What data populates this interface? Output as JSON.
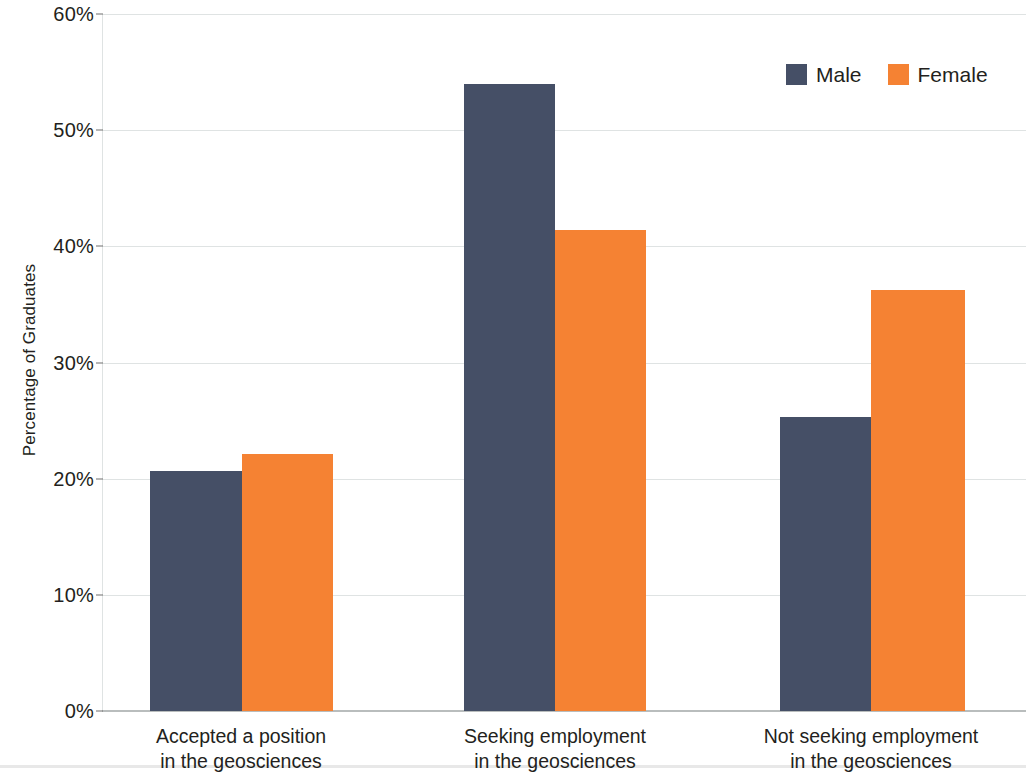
{
  "chart_data": {
    "type": "bar",
    "title": "",
    "subtitle": "",
    "xlabel": "",
    "ylabel": "Percentage of Graduates",
    "ylim": [
      0,
      60
    ],
    "ytick_values": [
      0,
      10,
      20,
      30,
      40,
      50,
      60
    ],
    "ytick_labels": [
      "0%",
      "10%",
      "20%",
      "30%",
      "40%",
      "50%",
      "60%"
    ],
    "grid": true,
    "legend_position": "top-right",
    "categories": [
      "Accepted a position in the geosciences",
      "Seeking employment in the geosciences",
      "Not seeking employment in the geosciences"
    ],
    "category_lines": [
      [
        "Accepted a position",
        "in the geosciences"
      ],
      [
        "Seeking employment",
        "in the geosciences"
      ],
      [
        "Not seeking employment",
        "in the geosciences"
      ]
    ],
    "series": [
      {
        "name": "Male",
        "color": "#454f66",
        "values": [
          20.7,
          54.0,
          25.3
        ]
      },
      {
        "name": "Female",
        "color": "#f58233",
        "values": [
          22.1,
          41.4,
          36.2
        ]
      }
    ]
  },
  "legend": {
    "items": [
      {
        "label": "Male",
        "swatch": "legend-swatch-male"
      },
      {
        "label": "Female",
        "swatch": "legend-swatch-female"
      }
    ]
  },
  "axis": {
    "y_title": "Percentage of Graduates"
  }
}
